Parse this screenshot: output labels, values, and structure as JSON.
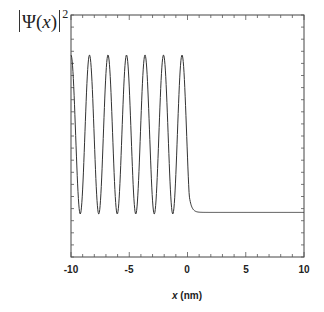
{
  "chart_data": {
    "type": "line",
    "title": "",
    "xlabel_var": "x",
    "xlabel_unit": "(nm)",
    "xlabel": "x (nm)",
    "ylabel": "|Ψ(x)|²",
    "ylabel_parts": {
      "psi": "Ψ",
      "open": "(",
      "var": "x",
      "close": ")",
      "exp": "2"
    },
    "xlim": [
      -10,
      10
    ],
    "ylim": [
      -0.25,
      1.25
    ],
    "x_ticks": [
      -10,
      -5,
      0,
      5,
      10
    ],
    "x_tick_labels": [
      "-10",
      "-5",
      "0",
      "5",
      "10"
    ],
    "grid": false,
    "series": [
      {
        "name": "|Ψ(x)|²",
        "description": "Oscillating probability density for x < 0 (7 peaks, period ≈ 1.58 nm, first peak at x = -10, last at x ≈ -0.47), decaying to a constant level near the trough value for x > ~1",
        "peaks_x": [
          -10.0,
          -8.42,
          -6.84,
          -5.26,
          -3.68,
          -2.1,
          -0.47
        ],
        "peak_value": 1.0,
        "trough_value": 0.0,
        "plateau_value": 0.01,
        "decay_start_x": 0.15,
        "decay_end_x": 1.2
      }
    ],
    "colors": {
      "line": "#333333",
      "frame": "#444444"
    }
  }
}
